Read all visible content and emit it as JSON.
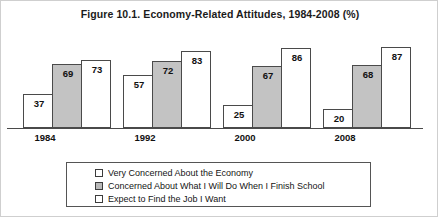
{
  "chart_data": {
    "type": "bar",
    "title": "Figure 10.1. Economy-Related Attitudes, 1984-2008 (%)",
    "xlabel": "",
    "ylabel": "",
    "ylim": [
      0,
      100
    ],
    "grid": false,
    "legend_position": "bottom",
    "categories": [
      "1984",
      "1992",
      "2000",
      "2008"
    ],
    "series": [
      {
        "name": "Very Concerned About the Economy",
        "fill": "white",
        "color": "#ffffff",
        "values": [
          37,
          57,
          25,
          20
        ]
      },
      {
        "name": "Concerned About What I Will Do When I Finish School",
        "fill": "gray",
        "color": "#c3c3c3",
        "values": [
          69,
          72,
          67,
          68
        ]
      },
      {
        "name": "Expect to Find the Job I Want",
        "fill": "white",
        "color": "#ffffff",
        "values": [
          73,
          83,
          86,
          87
        ]
      }
    ]
  },
  "figure": {
    "title": "Figure 10.1. Economy-Related Attitudes, 1984-2008 (%)",
    "years": [
      {
        "label": "1984"
      },
      {
        "label": "1992"
      },
      {
        "label": "2000"
      },
      {
        "label": "2008"
      }
    ],
    "groups": [
      {
        "year": "1984",
        "v1": "37",
        "v2": "69",
        "v3": "73"
      },
      {
        "year": "1992",
        "v1": "57",
        "v2": "72",
        "v3": "83"
      },
      {
        "year": "2000",
        "v1": "25",
        "v2": "67",
        "v3": "86"
      },
      {
        "year": "2008",
        "v1": "20",
        "v2": "68",
        "v3": "87"
      }
    ],
    "legend": [
      {
        "label": "Very Concerned About the Economy",
        "fill": "white"
      },
      {
        "label": "Concerned About What I Will Do When I Finish School",
        "fill": "gray"
      },
      {
        "label": "Expect to Find the Job I Want",
        "fill": "white"
      }
    ]
  }
}
